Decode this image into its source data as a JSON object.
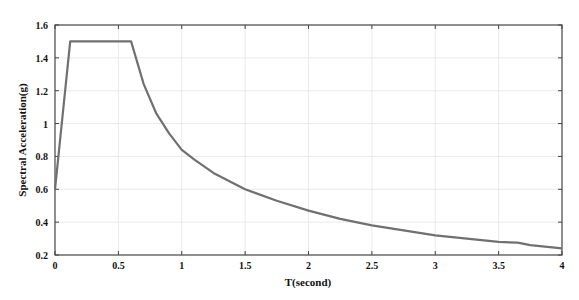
{
  "chart_data": {
    "type": "line",
    "title": "",
    "xlabel": "T(second)",
    "ylabel": "Spectral Acceleration(g)",
    "xlim": [
      0,
      4
    ],
    "ylim": [
      0.2,
      1.6
    ],
    "xticks": [
      0,
      0.5,
      1,
      1.5,
      2,
      2.5,
      3,
      3.5,
      4
    ],
    "xtick_labels": [
      "0",
      "0.5",
      "1",
      "1.5",
      "2",
      "2.5",
      "3",
      "3.5",
      "4"
    ],
    "yticks": [
      0.2,
      0.4,
      0.6,
      0.8,
      1,
      1.2,
      1.4,
      1.6
    ],
    "ytick_labels": [
      "0.2",
      "0.4",
      "0.6",
      "0.8",
      "1",
      "1.2",
      "1.4",
      "1.6"
    ],
    "grid": true,
    "legend": null,
    "series": [
      {
        "name": "Design spectrum",
        "color": "#707070",
        "x": [
          0,
          0.12,
          0.6,
          0.7,
          0.8,
          0.9,
          1.0,
          1.1,
          1.25,
          1.4,
          1.5,
          1.75,
          2.0,
          2.25,
          2.5,
          2.75,
          3.0,
          3.25,
          3.5,
          3.65,
          3.75,
          4.0
        ],
        "values": [
          0.6,
          1.5,
          1.5,
          1.24,
          1.06,
          0.94,
          0.84,
          0.78,
          0.7,
          0.64,
          0.6,
          0.53,
          0.47,
          0.42,
          0.38,
          0.35,
          0.32,
          0.3,
          0.28,
          0.275,
          0.26,
          0.24
        ]
      }
    ]
  }
}
